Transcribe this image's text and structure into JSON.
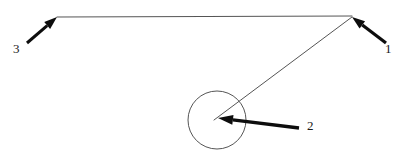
{
  "figure": {
    "name": "technical-line-drawing-with-callouts",
    "width": 410,
    "height": 155,
    "background_color": "#ffffff",
    "line_color": "#555555",
    "arrow_color": "#0d0d0d",
    "label_color": "#1a1a1a"
  },
  "geometry": {
    "horizontal_line": {
      "name": "top-horizontal-line",
      "x1": 57,
      "y1": 17,
      "x2": 352,
      "y2": 16,
      "stroke_width": 1.1
    },
    "diagonal_line": {
      "name": "diagonal-leader-line",
      "x1": 352,
      "y1": 17,
      "x2": 214,
      "y2": 120,
      "stroke_width": 1.0
    },
    "circle": {
      "name": "circle-outline",
      "cx": 217,
      "cy": 120,
      "r": 29,
      "stroke_width": 1.0,
      "fill": "none"
    }
  },
  "callouts": [
    {
      "id": "1",
      "label": "1",
      "arrow_name": "callout-arrow-1",
      "label_name": "callout-label-1",
      "tail_x": 386,
      "tail_y": 43,
      "tip_x": 352,
      "tip_y": 17,
      "shaft_width": 3.2,
      "head_length": 13,
      "head_width": 9,
      "label_x": 385,
      "label_y": 42
    },
    {
      "id": "2",
      "label": "2",
      "arrow_name": "callout-arrow-2",
      "label_name": "callout-label-2",
      "tail_x": 299,
      "tail_y": 128,
      "tip_x": 218,
      "tip_y": 118,
      "shaft_width": 3.4,
      "head_length": 15,
      "head_width": 10,
      "label_x": 307,
      "label_y": 119
    },
    {
      "id": "3",
      "label": "3",
      "arrow_name": "callout-arrow-3",
      "label_name": "callout-label-3",
      "tail_x": 27,
      "tail_y": 43,
      "tip_x": 57,
      "tip_y": 17,
      "shaft_width": 3.0,
      "head_length": 13,
      "head_width": 9,
      "label_x": 13,
      "label_y": 42
    }
  ]
}
